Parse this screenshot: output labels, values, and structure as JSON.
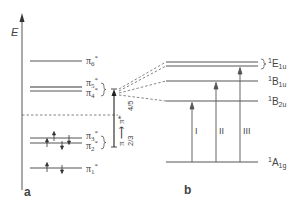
{
  "axis": {
    "label": "E"
  },
  "panel_a": {
    "label": "a",
    "levels": [
      {
        "name": "π6*",
        "base": "π",
        "sub": "6",
        "sup": "*",
        "y": 61
      },
      {
        "name": "π5*",
        "base": "π",
        "sub": "5",
        "sup": "*",
        "y": 87
      },
      {
        "name": "π4*",
        "base": "π",
        "sub": "4",
        "sup": "*",
        "y": 91
      },
      {
        "name": "π3*",
        "base": "π",
        "sub": "3",
        "sup": "*",
        "y": 138
      },
      {
        "name": "π2*",
        "base": "π",
        "sub": "2",
        "sup": "*",
        "y": 143
      },
      {
        "name": "π1*",
        "base": "π",
        "sub": "1",
        "sup": "*",
        "y": 168
      }
    ],
    "transition": {
      "from": "π",
      "to": "π*",
      "label_lower": "2/3",
      "label_upper": "4/5"
    }
  },
  "panel_b": {
    "label": "b",
    "states": [
      {
        "name": "1E1u",
        "sup": "1",
        "base": "E",
        "sub": "1u"
      },
      {
        "name": "1B1u",
        "sup": "1",
        "base": "B",
        "sub": "1u"
      },
      {
        "name": "1B2u",
        "sup": "1",
        "base": "B",
        "sub": "2u"
      },
      {
        "name": "1A1g",
        "sup": "1",
        "base": "A",
        "sub": "1g"
      }
    ],
    "transitions": [
      {
        "label": "I",
        "to": "1B2u"
      },
      {
        "label": "II",
        "to": "1B1u"
      },
      {
        "label": "III",
        "to": "1E1u"
      }
    ]
  }
}
